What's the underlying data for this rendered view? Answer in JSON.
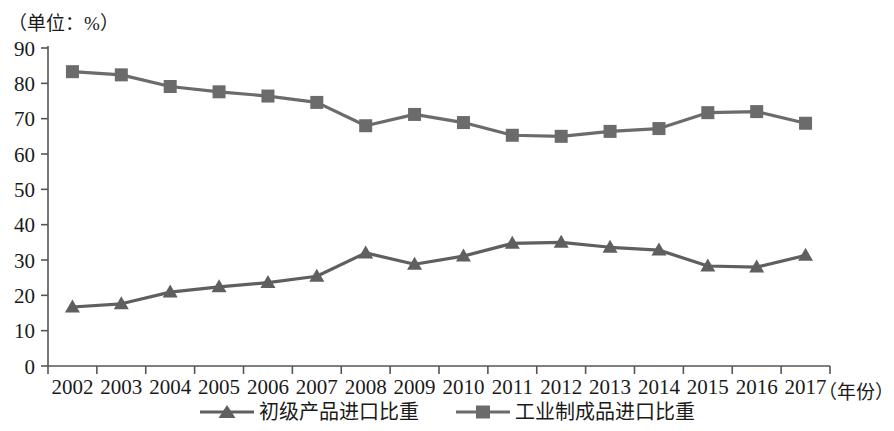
{
  "unit_label": "（单位：%）",
  "xaxis_title": "（年份）",
  "colors": {
    "series_primary": "#5f5f5f",
    "series_secondary": "#6b6b6b",
    "axis": "#555555",
    "text": "#1a1a1a",
    "background": "#ffffff"
  },
  "legend": {
    "items": [
      {
        "label": "初级产品进口比重",
        "marker": "triangle-marker-icon",
        "color": "#5f5f5f"
      },
      {
        "label": "工业制成品进口比重",
        "marker": "square-marker-icon",
        "color": "#6b6b6b"
      }
    ]
  },
  "chart_data": {
    "type": "line",
    "title": "",
    "subtitle": "",
    "xlabel": "（年份）",
    "ylabel": "（单位：%）",
    "ylim": [
      0,
      90
    ],
    "ytick_labels": [
      "0",
      "10",
      "20",
      "30",
      "40",
      "50",
      "60",
      "70",
      "80",
      "90"
    ],
    "yticks": [
      0,
      10,
      20,
      30,
      40,
      50,
      60,
      70,
      80,
      90
    ],
    "grid": false,
    "legend_position": "bottom-center",
    "categories": [
      "2002",
      "2003",
      "2004",
      "2005",
      "2006",
      "2007",
      "2008",
      "2009",
      "2010",
      "2011",
      "2012",
      "2013",
      "2014",
      "2015",
      "2016",
      "2017"
    ],
    "x": [
      2002,
      2003,
      2004,
      2005,
      2006,
      2007,
      2008,
      2009,
      2010,
      2011,
      2012,
      2013,
      2014,
      2015,
      2016,
      2017
    ],
    "series": [
      {
        "name": "初级产品进口比重",
        "marker": "triangle",
        "color": "#5f5f5f",
        "values": [
          16.7,
          17.6,
          20.9,
          22.4,
          23.6,
          25.4,
          32.0,
          28.8,
          31.1,
          34.7,
          35.0,
          33.6,
          32.8,
          28.3,
          28.0,
          31.3
        ]
      },
      {
        "name": "工业制成品进口比重",
        "marker": "square",
        "color": "#6b6b6b",
        "values": [
          83.3,
          82.4,
          79.1,
          77.6,
          76.4,
          74.6,
          68.0,
          71.2,
          68.9,
          65.3,
          65.0,
          66.4,
          67.2,
          71.7,
          72.0,
          68.7
        ]
      }
    ]
  }
}
